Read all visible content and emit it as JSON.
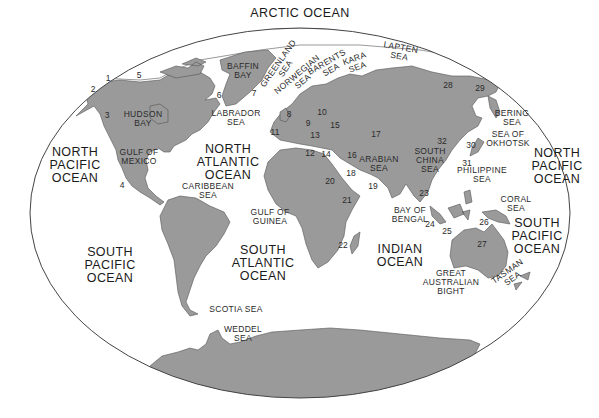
{
  "map": {
    "title": "World Oceans and Seas",
    "colors": {
      "land": "#9a9a9a",
      "water": "#ffffff",
      "outline": "#555555",
      "text": "#222222"
    },
    "oceans": [
      {
        "id": "arctic",
        "label": "ARCTIC OCEAN",
        "x": 300,
        "y": 14
      },
      {
        "id": "north-pacific-west",
        "label": "NORTH\nPACIFIC\nOCEAN",
        "x": 75,
        "y": 166
      },
      {
        "id": "north-atlantic",
        "label": "NORTH\nATLANTIC\nOCEAN",
        "x": 228,
        "y": 163
      },
      {
        "id": "north-pacific-east",
        "label": "NORTH\nPACIFIC\nOCEAN",
        "x": 557,
        "y": 167
      },
      {
        "id": "south-pacific-west",
        "label": "SOUTH\nPACIFIC\nOCEAN",
        "x": 110,
        "y": 266
      },
      {
        "id": "south-atlantic",
        "label": "SOUTH\nATLANTIC\nOCEAN",
        "x": 263,
        "y": 264
      },
      {
        "id": "indian",
        "label": "INDIAN\nOCEAN",
        "x": 400,
        "y": 256
      },
      {
        "id": "south-pacific-east",
        "label": "SOUTH\nPACIFIC\nOCEAN",
        "x": 537,
        "y": 237
      }
    ],
    "seas": [
      {
        "id": "baffin-bay",
        "label": "BAFFIN\nBAY",
        "x": 243,
        "y": 71
      },
      {
        "id": "greenland-sea",
        "label": "GREENLAND\nSEA",
        "x": 282,
        "y": 66,
        "rotate": -55
      },
      {
        "id": "norwegian-sea",
        "label": "NORWEGIAN\nSEA",
        "x": 300,
        "y": 78,
        "rotate": -40
      },
      {
        "id": "barents-sea",
        "label": "BARENTS\nSEA",
        "x": 329,
        "y": 66,
        "rotate": -30
      },
      {
        "id": "kara-sea",
        "label": "KARA\nSEA",
        "x": 356,
        "y": 63,
        "rotate": -20
      },
      {
        "id": "lapten-sea",
        "label": "LAPTEN\nSEA",
        "x": 400,
        "y": 52,
        "rotate": 10
      },
      {
        "id": "bering-sea",
        "label": "BERING\nSEA",
        "x": 512,
        "y": 118
      },
      {
        "id": "sea-of-okhotsk",
        "label": "SEA OF\nOKHOTSK",
        "x": 508,
        "y": 139
      },
      {
        "id": "hudson-bay",
        "label": "HUDSON\nBAY",
        "x": 143,
        "y": 119
      },
      {
        "id": "labrador-sea",
        "label": "LABRADOR\nSEA",
        "x": 236,
        "y": 118
      },
      {
        "id": "gulf-of-mexico",
        "label": "GULF OF\nMEXICO",
        "x": 139,
        "y": 157
      },
      {
        "id": "caribbean-sea",
        "label": "CARIBBEAN\nSEA",
        "x": 208,
        "y": 191
      },
      {
        "id": "gulf-of-guinea",
        "label": "GULF OF\nGUINEA",
        "x": 270,
        "y": 217
      },
      {
        "id": "arabian-sea",
        "label": "ARABIAN\nSEA",
        "x": 379,
        "y": 164
      },
      {
        "id": "south-china-sea",
        "label": "SOUTH\nCHINA\nSEA",
        "x": 430,
        "y": 160
      },
      {
        "id": "bay-of-bengal",
        "label": "BAY OF\nBENGAL",
        "x": 410,
        "y": 215
      },
      {
        "id": "philippine-sea",
        "label": "PHILIPPINE\nSEA",
        "x": 482,
        "y": 175
      },
      {
        "id": "coral-sea",
        "label": "CORAL\nSEA",
        "x": 516,
        "y": 204
      },
      {
        "id": "great-australian-bight",
        "label": "GREAT\nAUSTRALIAN\nBIGHT",
        "x": 451,
        "y": 282
      },
      {
        "id": "tasman-sea",
        "label": "TASMAN\nSEA",
        "x": 510,
        "y": 275,
        "rotate": -35
      },
      {
        "id": "scotia-sea",
        "label": "SCOTIA SEA",
        "x": 236,
        "y": 309
      },
      {
        "id": "weddel-sea",
        "label": "WEDDEL\nSEA",
        "x": 243,
        "y": 334
      }
    ],
    "numbers": [
      {
        "n": "1",
        "x": 108,
        "y": 78
      },
      {
        "n": "2",
        "x": 93,
        "y": 89
      },
      {
        "n": "3",
        "x": 107,
        "y": 115
      },
      {
        "n": "4",
        "x": 122,
        "y": 185
      },
      {
        "n": "5",
        "x": 139,
        "y": 75
      },
      {
        "n": "6",
        "x": 219,
        "y": 95
      },
      {
        "n": "7",
        "x": 254,
        "y": 93
      },
      {
        "n": "8",
        "x": 289,
        "y": 114
      },
      {
        "n": "9",
        "x": 308,
        "y": 123
      },
      {
        "n": "10",
        "x": 322,
        "y": 112
      },
      {
        "n": "11",
        "x": 275,
        "y": 132
      },
      {
        "n": "12",
        "x": 310,
        "y": 153
      },
      {
        "n": "13",
        "x": 315,
        "y": 135
      },
      {
        "n": "14",
        "x": 326,
        "y": 154
      },
      {
        "n": "15",
        "x": 335,
        "y": 125
      },
      {
        "n": "16",
        "x": 352,
        "y": 155
      },
      {
        "n": "17",
        "x": 376,
        "y": 134
      },
      {
        "n": "18",
        "x": 351,
        "y": 173
      },
      {
        "n": "19",
        "x": 373,
        "y": 186
      },
      {
        "n": "20",
        "x": 330,
        "y": 181
      },
      {
        "n": "21",
        "x": 347,
        "y": 200
      },
      {
        "n": "22",
        "x": 343,
        "y": 245
      },
      {
        "n": "23",
        "x": 424,
        "y": 193
      },
      {
        "n": "24",
        "x": 430,
        "y": 224
      },
      {
        "n": "25",
        "x": 447,
        "y": 231
      },
      {
        "n": "26",
        "x": 484,
        "y": 222
      },
      {
        "n": "27",
        "x": 482,
        "y": 244
      },
      {
        "n": "28",
        "x": 448,
        "y": 85
      },
      {
        "n": "29",
        "x": 480,
        "y": 88
      },
      {
        "n": "30",
        "x": 471,
        "y": 145
      },
      {
        "n": "31",
        "x": 467,
        "y": 163
      },
      {
        "n": "32",
        "x": 442,
        "y": 141
      }
    ]
  }
}
